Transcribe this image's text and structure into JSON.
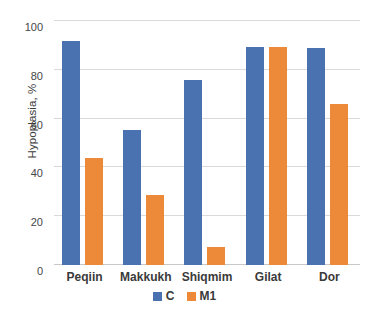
{
  "chart_data": {
    "type": "bar",
    "title": "",
    "subtitle": "",
    "xlabel": "",
    "ylabel": "Hypoplasia, %",
    "categories": [
      "Peqiin",
      "Makkukh",
      "Shiqmim",
      "Gilat",
      "Dor"
    ],
    "series": [
      {
        "name": "C",
        "color": "#4a72b0",
        "values": [
          92,
          55.5,
          76,
          89.5,
          89
        ]
      },
      {
        "name": "M1",
        "color": "#ed8a3a",
        "values": [
          44,
          28.5,
          7.5,
          89.5,
          66
        ]
      }
    ],
    "ylim": [
      0,
      100
    ],
    "yticks": [
      0,
      20,
      40,
      60,
      80,
      100
    ],
    "ytick_labels": [
      "0",
      "20",
      "40",
      "60",
      "80",
      "100"
    ],
    "grid": true,
    "grid_axis": "y",
    "legend": {
      "position": "bottom",
      "entries": [
        {
          "label": "C",
          "color": "#4a72b0"
        },
        {
          "label": "M1",
          "color": "#ed8a3a"
        }
      ]
    },
    "background_color": "#ffffff"
  }
}
